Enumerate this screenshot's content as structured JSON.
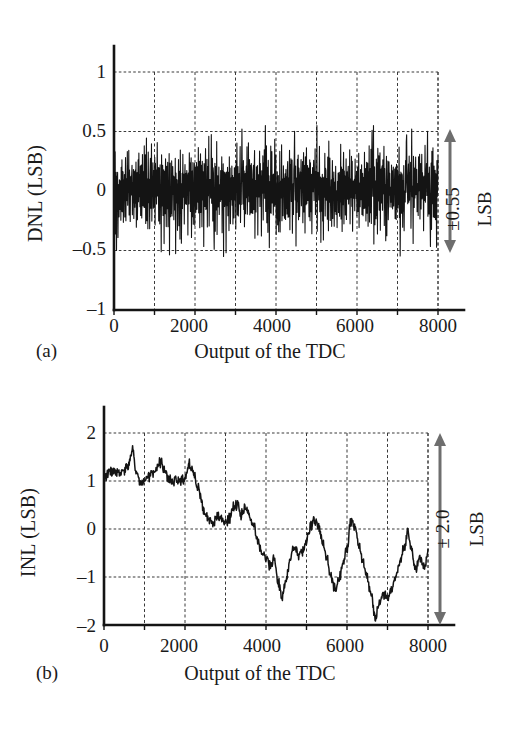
{
  "figure": {
    "panels": [
      {
        "tag": "(a)",
        "ylabel": "DNL (LSB)",
        "xlabel": "Output of the TDC",
        "annotation_value": "±0.55",
        "annotation_unit": "LSB",
        "yticks": [
          "1",
          "0.5",
          "0",
          "–0.5",
          "–1"
        ],
        "xticks": [
          "0",
          "2000",
          "4000",
          "6000",
          "8000"
        ]
      },
      {
        "tag": "(b)",
        "ylabel": "INL (LSB)",
        "xlabel": "Output of the TDC",
        "annotation_value": "± 2.0",
        "annotation_unit": "LSB",
        "yticks": [
          "2",
          "1",
          "0",
          "–1",
          "–2"
        ],
        "xticks": [
          "0",
          "2000",
          "4000",
          "6000",
          "8000"
        ]
      }
    ],
    "ink_color": "#141414",
    "grid_color": "#3a3a3a",
    "arrow_color": "#6e6e6e"
  },
  "chart_data": [
    {
      "type": "line",
      "title": "",
      "subtitle": "(a)",
      "xlabel": "Output of the TDC",
      "ylabel": "DNL (LSB)",
      "xlim": [
        0,
        8000
      ],
      "ylim": [
        -1,
        1
      ],
      "xticks": [
        0,
        2000,
        4000,
        6000,
        8000
      ],
      "yticks": [
        -1,
        -0.5,
        0,
        0.5,
        1
      ],
      "x_minor_step": 1000,
      "grid": true,
      "legend": "none",
      "annotation": "±0.55 LSB",
      "series": [
        {
          "name": "DNL",
          "description": "dense zero-mean noise, bulk within ±0.3 LSB, occasional spikes to ±0.55 LSB",
          "mean": 0.0,
          "min": -0.55,
          "max": 0.55,
          "n_points": 8192,
          "values": [
            -0.3,
            0.12,
            -0.18,
            0.22,
            -0.45,
            0.05,
            0.18,
            -0.22,
            0.1,
            -0.12,
            0.2,
            -0.28,
            0.08,
            0.15,
            -0.1,
            0.25,
            -0.2,
            0.05,
            0.14,
            -0.24,
            0.18,
            -0.08,
            0.22,
            -0.16,
            0.09,
            0.2,
            -0.26,
            0.12,
            -0.06,
            0.24,
            -0.18,
            0.1,
            0.16,
            -0.3,
            0.2,
            -0.12,
            0.08,
            0.26,
            -0.22,
            0.14,
            -0.1,
            0.3,
            -0.16,
            0.06,
            0.18,
            -0.24,
            0.12,
            0.22,
            -0.14,
            0.08,
            0.28,
            -0.2,
            0.1,
            -0.08,
            0.24,
            -0.3,
            0.16,
            0.06,
            -0.18,
            0.22,
            -0.12,
            0.32,
            -0.22,
            0.1,
            0.18,
            -0.26,
            0.08,
            0.2,
            -0.14,
            0.26,
            -0.18,
            0.12,
            -0.08,
            0.3,
            -0.24,
            0.14,
            0.2,
            -0.12,
            0.06,
            0.22,
            -0.28,
            0.18,
            0.1,
            -0.2,
            0.26,
            -0.14,
            0.08,
            0.24,
            -0.18,
            0.12,
            0.34,
            -0.26,
            0.1,
            0.16,
            -0.22,
            0.28,
            -0.1,
            0.06,
            0.2,
            -0.3,
            0.14,
            0.24,
            -0.16,
            0.08,
            0.3,
            -0.2,
            0.12,
            -0.06,
            0.26,
            -0.24,
            0.18,
            0.1,
            -0.14,
            0.44,
            -0.28,
            0.16,
            0.06,
            0.22,
            -0.2,
            0.12,
            0.52,
            -0.18,
            0.1,
            0.24,
            -0.3,
            0.14,
            0.08,
            -0.22,
            0.28,
            -0.12,
            0.18,
            -0.5,
            0.2,
            0.1,
            -0.16,
            0.34,
            -0.24,
            0.12,
            0.26,
            -0.18,
            0.08,
            0.22,
            -0.28,
            0.16,
            0.1,
            -0.2,
            0.3,
            -0.14,
            0.06,
            0.24
          ]
        }
      ]
    },
    {
      "type": "line",
      "title": "",
      "subtitle": "(b)",
      "xlabel": "Output of the TDC",
      "ylabel": "INL (LSB)",
      "xlim": [
        0,
        8000
      ],
      "ylim": [
        -2,
        2
      ],
      "xticks": [
        0,
        2000,
        4000,
        6000,
        8000
      ],
      "yticks": [
        -2,
        -1,
        0,
        1,
        2
      ],
      "x_minor_step": 1000,
      "grid": true,
      "legend": "none",
      "annotation": "± 2.0 LSB",
      "series": [
        {
          "name": "INL",
          "description": "slow drift from about +1.1 LSB near code 0, plateau to code 2200, descending to about -1.5 LSB near code 4300, oscillating between -1.5 and +0.2 LSB, minimum about -1.9 near code 6600, recovering to about -0.5 LSB at code 8000",
          "min": -1.95,
          "max": 1.65,
          "n_points": 8192,
          "x": [
            0,
            200,
            400,
            600,
            700,
            800,
            900,
            1000,
            1200,
            1400,
            1500,
            1600,
            1800,
            2000,
            2100,
            2200,
            2300,
            2400,
            2500,
            2600,
            2700,
            2800,
            2900,
            3000,
            3100,
            3200,
            3300,
            3400,
            3500,
            3600,
            3700,
            3800,
            3900,
            4000,
            4100,
            4200,
            4300,
            4400,
            4500,
            4600,
            4700,
            4800,
            4900,
            5000,
            5100,
            5200,
            5300,
            5400,
            5500,
            5600,
            5700,
            5800,
            5900,
            6000,
            6100,
            6200,
            6300,
            6400,
            6500,
            6600,
            6700,
            6800,
            6900,
            7000,
            7100,
            7200,
            7300,
            7400,
            7500,
            7600,
            7700,
            7800,
            7900,
            8000
          ],
          "y": [
            1.1,
            1.2,
            1.15,
            1.3,
            1.62,
            1.2,
            0.95,
            1.0,
            1.15,
            1.38,
            1.2,
            1.02,
            1.0,
            1.05,
            1.35,
            1.2,
            0.92,
            0.6,
            0.3,
            0.18,
            0.12,
            0.28,
            0.2,
            0.1,
            0.22,
            0.45,
            0.5,
            0.3,
            0.42,
            0.25,
            0.05,
            -0.25,
            -0.5,
            -0.6,
            -0.75,
            -0.62,
            -1.1,
            -1.45,
            -1.0,
            -0.62,
            -0.35,
            -0.55,
            -0.45,
            -0.25,
            0.05,
            0.18,
            0.02,
            -0.3,
            -0.6,
            -0.95,
            -1.25,
            -1.05,
            -0.75,
            -0.4,
            0.18,
            0.05,
            -0.35,
            -0.7,
            -1.05,
            -1.35,
            -1.85,
            -1.5,
            -1.38,
            -1.42,
            -1.3,
            -1.05,
            -0.7,
            -0.4,
            -0.05,
            -0.45,
            -0.85,
            -0.6,
            -0.8,
            -0.55
          ]
        }
      ]
    }
  ]
}
